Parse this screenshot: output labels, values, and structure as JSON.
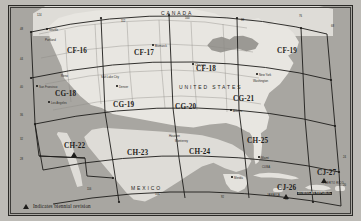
{
  "map": {
    "title": "United States Sectional Chart Index",
    "projection": "Lambert Conformal Conic",
    "ocean_color": "#a8a6a1",
    "land_color": "#e8e6e1",
    "frame_color": "#2a2926"
  },
  "countries": [
    {
      "name": "CANADA",
      "x": 152,
      "y": 4
    },
    {
      "name": "UNITED STATES",
      "x": 170,
      "y": 78
    },
    {
      "name": "MEXICO",
      "x": 122,
      "y": 179
    }
  ],
  "cells": [
    {
      "id": "CF-16",
      "x": 58,
      "y": 41,
      "revision": false
    },
    {
      "id": "CF-17",
      "x": 125,
      "y": 43,
      "revision": false
    },
    {
      "id": "CF-18",
      "x": 187,
      "y": 59,
      "revision": false
    },
    {
      "id": "CF-19",
      "x": 268,
      "y": 41,
      "revision": false
    },
    {
      "id": "CG-18",
      "x": 46,
      "y": 84,
      "revision": false
    },
    {
      "id": "CG-19",
      "x": 104,
      "y": 95,
      "revision": false
    },
    {
      "id": "CG-20",
      "x": 166,
      "y": 97,
      "revision": false
    },
    {
      "id": "CG-21",
      "x": 224,
      "y": 89,
      "revision": false
    },
    {
      "id": "CH-22",
      "x": 55,
      "y": 136,
      "revision": true
    },
    {
      "id": "CH-23",
      "x": 118,
      "y": 143,
      "revision": false
    },
    {
      "id": "CH-24",
      "x": 180,
      "y": 142,
      "revision": false
    },
    {
      "id": "CH-25",
      "x": 238,
      "y": 131,
      "revision": false
    },
    {
      "id": "CJ-26",
      "x": 268,
      "y": 178,
      "revision": true
    },
    {
      "id": "CJ-27",
      "x": 308,
      "y": 163,
      "revision": true
    }
  ],
  "places": [
    {
      "name": "Seattle",
      "x": 40,
      "y": 22
    },
    {
      "name": "Portland",
      "x": 36,
      "y": 32
    },
    {
      "name": "Salt Lake City",
      "x": 92,
      "y": 69
    },
    {
      "name": "Reno",
      "x": 52,
      "y": 68
    },
    {
      "name": "San Francisco",
      "x": 30,
      "y": 79
    },
    {
      "name": "Los Angeles",
      "x": 42,
      "y": 95
    },
    {
      "name": "Denver",
      "x": 110,
      "y": 79
    },
    {
      "name": "Bismarck",
      "x": 146,
      "y": 38
    },
    {
      "name": "Chicago",
      "x": 186,
      "y": 57
    },
    {
      "name": "New York",
      "x": 250,
      "y": 67
    },
    {
      "name": "Washington",
      "x": 248,
      "y": 73
    },
    {
      "name": "Atlanta",
      "x": 224,
      "y": 103
    },
    {
      "name": "Miami",
      "x": 252,
      "y": 150
    },
    {
      "name": "Houston",
      "x": 160,
      "y": 128
    },
    {
      "name": "Monterrey",
      "x": 166,
      "y": 133
    },
    {
      "name": "Merida",
      "x": 225,
      "y": 170
    }
  ],
  "islands": [
    {
      "name": "CUBA",
      "x": 253,
      "y": 160,
      "highlight": false
    },
    {
      "name": "JAMAICA",
      "x": 258,
      "y": 188,
      "highlight": false
    },
    {
      "name": "DOMINICAN REPUBLIC",
      "x": 292,
      "y": 186,
      "highlight": true
    },
    {
      "name": "PUERTO RICO",
      "x": 318,
      "y": 176,
      "highlight": false
    }
  ],
  "lat_ticks": [
    {
      "label": "48",
      "x": 11,
      "y": 22
    },
    {
      "label": "44",
      "x": 11,
      "y": 52
    },
    {
      "label": "40",
      "x": 11,
      "y": 80
    },
    {
      "label": "36",
      "x": 11,
      "y": 108
    },
    {
      "label": "32",
      "x": 11,
      "y": 132
    },
    {
      "label": "28",
      "x": 11,
      "y": 152
    },
    {
      "label": "24",
      "x": 336,
      "y": 150
    },
    {
      "label": "20",
      "x": 336,
      "y": 178
    }
  ],
  "lon_ticks": [
    {
      "label": "124",
      "x": 28,
      "y": 8
    },
    {
      "label": "112",
      "x": 112,
      "y": 14
    },
    {
      "label": "100",
      "x": 176,
      "y": 11
    },
    {
      "label": "88",
      "x": 232,
      "y": 13
    },
    {
      "label": "76",
      "x": 290,
      "y": 9
    },
    {
      "label": "68",
      "x": 324,
      "y": 19
    },
    {
      "label": "116",
      "x": 78,
      "y": 182
    },
    {
      "label": "104",
      "x": 146,
      "y": 187
    },
    {
      "label": "92",
      "x": 212,
      "y": 190
    },
    {
      "label": "80",
      "x": 276,
      "y": 192
    }
  ],
  "legend": {
    "marker": "triangle-marker",
    "text": "Indicates biennial revision"
  }
}
